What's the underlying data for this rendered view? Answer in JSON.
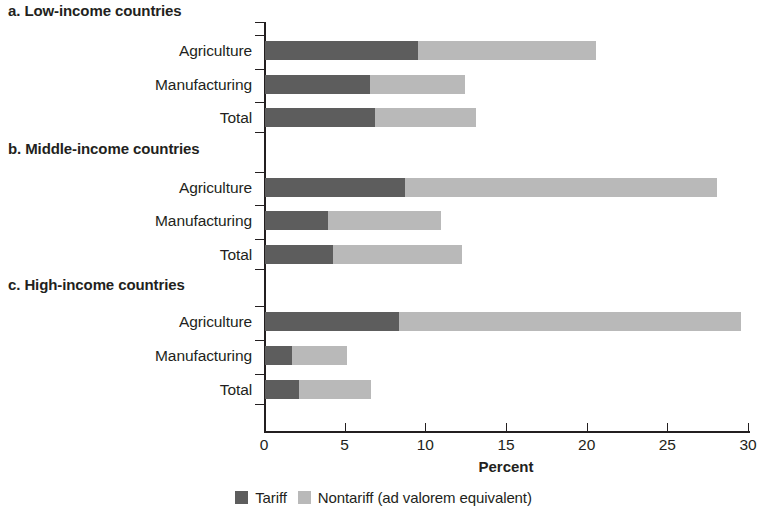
{
  "chart_data": {
    "type": "bar",
    "orientation": "horizontal",
    "stacked": true,
    "title": "",
    "xlabel": "Percent",
    "ylabel": "",
    "xlim": [
      0,
      30
    ],
    "xticks": [
      0,
      5,
      10,
      15,
      20,
      25,
      30
    ],
    "xtick_labels": [
      "0",
      "5",
      "10",
      "15",
      "20",
      "25",
      "30"
    ],
    "grid": false,
    "legend_position": "bottom",
    "series": [
      {
        "name": "Tariff",
        "color": "#5d5d5d"
      },
      {
        "name": "Nontariff (ad valorem equivalent)",
        "color": "#b9b9b9"
      }
    ],
    "panels": [
      {
        "title": "a. Low-income countries",
        "categories": [
          "Agriculture",
          "Manufacturing",
          "Total"
        ],
        "values": {
          "Tariff": [
            9.5,
            6.5,
            6.8
          ],
          "Nontariff (ad valorem equivalent)": [
            11.0,
            5.9,
            6.3
          ]
        },
        "totals": [
          20.5,
          12.4,
          13.1
        ]
      },
      {
        "title": "b. Middle-income countries",
        "categories": [
          "Agriculture",
          "Manufacturing",
          "Total"
        ],
        "values": {
          "Tariff": [
            8.7,
            3.9,
            4.2
          ],
          "Nontariff (ad valorem equivalent)": [
            19.3,
            7.0,
            8.0
          ]
        },
        "totals": [
          28.0,
          10.9,
          12.2
        ]
      },
      {
        "title": "c. High-income countries",
        "categories": [
          "Agriculture",
          "Manufacturing",
          "Total"
        ],
        "values": {
          "Tariff": [
            8.3,
            1.7,
            2.1
          ],
          "Nontariff (ad valorem equivalent)": [
            21.2,
            3.4,
            4.5
          ]
        },
        "totals": [
          29.5,
          5.1,
          6.6
        ]
      }
    ]
  },
  "axis": {
    "title": "Percent",
    "ticks": [
      "0",
      "5",
      "10",
      "15",
      "20",
      "25",
      "30"
    ]
  },
  "legend": {
    "items": [
      {
        "label": "Tariff",
        "color": "#5d5d5d"
      },
      {
        "label": "Nontariff (ad valorem equivalent)",
        "color": "#b9b9b9"
      }
    ]
  },
  "panels": [
    {
      "title": "a. Low-income countries",
      "categories": [
        "Agriculture",
        "Manufacturing",
        "Total"
      ]
    },
    {
      "title": "b. Middle-income countries",
      "categories": [
        "Agriculture",
        "Manufacturing",
        "Total"
      ]
    },
    {
      "title": "c. High-income countries",
      "categories": [
        "Agriculture",
        "Manufacturing",
        "Total"
      ]
    }
  ]
}
